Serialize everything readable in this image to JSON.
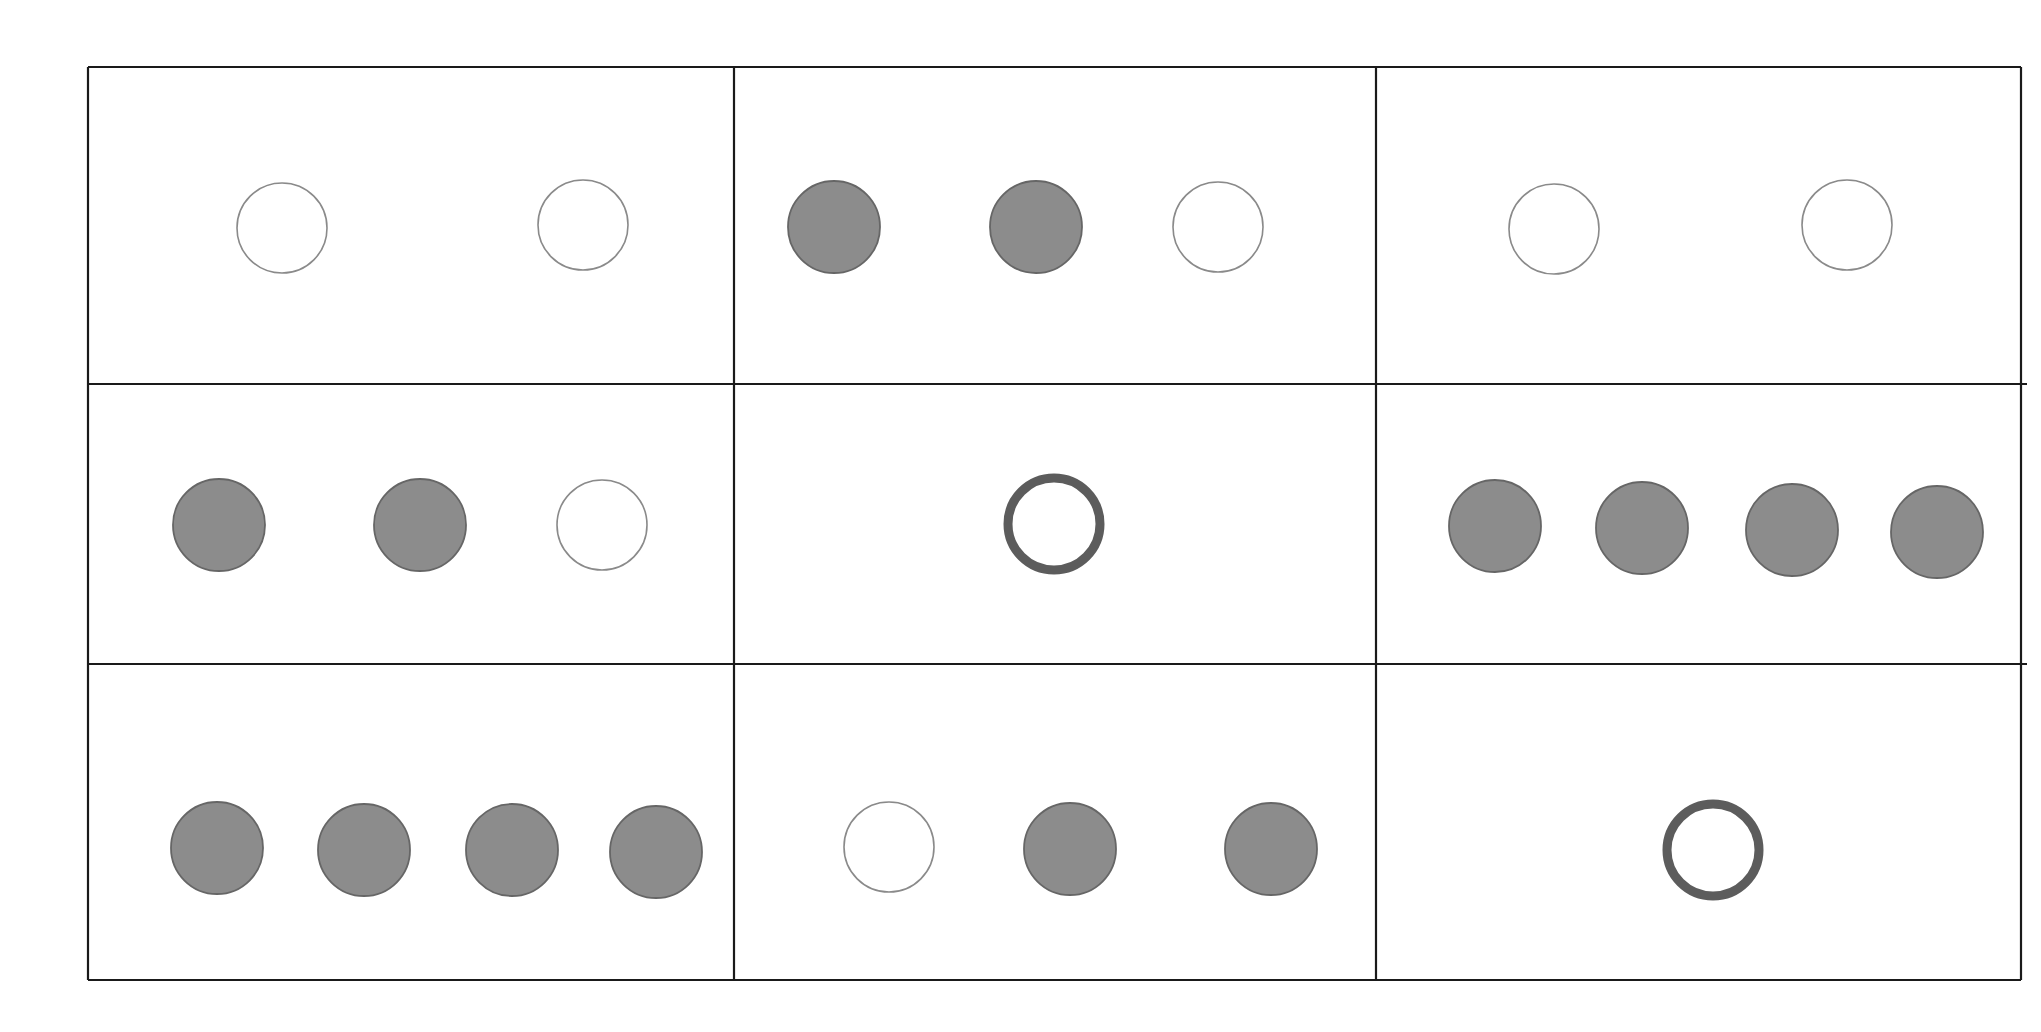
{
  "figure": {
    "rows": 3,
    "cols": 3,
    "colors": {
      "grid_line": "#1a1a1a",
      "empty_circle_stroke": "#8a8a8a",
      "filled_circle_fill": "#8c8c8c",
      "filled_circle_stroke": "#666666",
      "ring_stroke": "#5c5c5c",
      "background": "#ffffff"
    },
    "grid": {
      "x": [
        88,
        734,
        1376,
        2021
      ],
      "y": [
        67,
        384,
        664,
        980
      ]
    },
    "cells": [
      {
        "row": 0,
        "col": 0,
        "circles": [
          {
            "type": "empty",
            "cx": 282,
            "cy": 228
          },
          {
            "type": "empty",
            "cx": 583,
            "cy": 225
          }
        ]
      },
      {
        "row": 0,
        "col": 1,
        "circles": [
          {
            "type": "filled",
            "cx": 834,
            "cy": 227
          },
          {
            "type": "filled",
            "cx": 1036,
            "cy": 227
          },
          {
            "type": "empty",
            "cx": 1218,
            "cy": 227
          }
        ]
      },
      {
        "row": 0,
        "col": 2,
        "circles": [
          {
            "type": "empty",
            "cx": 1554,
            "cy": 229
          },
          {
            "type": "empty",
            "cx": 1847,
            "cy": 225
          }
        ]
      },
      {
        "row": 1,
        "col": 0,
        "circles": [
          {
            "type": "filled",
            "cx": 219,
            "cy": 525
          },
          {
            "type": "filled",
            "cx": 420,
            "cy": 525
          },
          {
            "type": "empty",
            "cx": 602,
            "cy": 525
          }
        ]
      },
      {
        "row": 1,
        "col": 1,
        "circles": [
          {
            "type": "ring",
            "cx": 1054,
            "cy": 524
          }
        ]
      },
      {
        "row": 1,
        "col": 2,
        "circles": [
          {
            "type": "filled",
            "cx": 1495,
            "cy": 526
          },
          {
            "type": "filled",
            "cx": 1642,
            "cy": 528
          },
          {
            "type": "filled",
            "cx": 1792,
            "cy": 530
          },
          {
            "type": "filled",
            "cx": 1937,
            "cy": 532
          }
        ]
      },
      {
        "row": 2,
        "col": 0,
        "circles": [
          {
            "type": "filled",
            "cx": 217,
            "cy": 848
          },
          {
            "type": "filled",
            "cx": 364,
            "cy": 850
          },
          {
            "type": "filled",
            "cx": 512,
            "cy": 850
          },
          {
            "type": "filled",
            "cx": 656,
            "cy": 852
          }
        ]
      },
      {
        "row": 2,
        "col": 1,
        "circles": [
          {
            "type": "empty",
            "cx": 889,
            "cy": 847
          },
          {
            "type": "filled",
            "cx": 1070,
            "cy": 849
          },
          {
            "type": "filled",
            "cx": 1271,
            "cy": 849
          }
        ]
      },
      {
        "row": 2,
        "col": 2,
        "circles": [
          {
            "type": "ring",
            "cx": 1713,
            "cy": 850
          }
        ]
      }
    ],
    "circle_sizes": {
      "empty_radius": 45,
      "filled_radius": 46,
      "ring_radius": 46,
      "ring_stroke_width": 9
    }
  }
}
